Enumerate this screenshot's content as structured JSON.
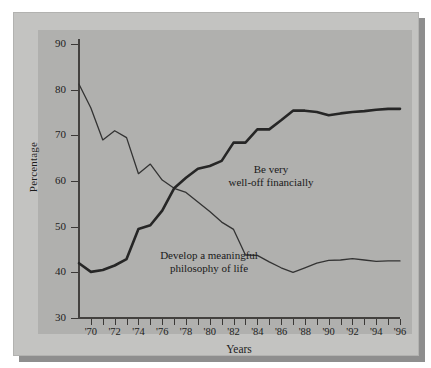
{
  "chart_data": {
    "type": "line",
    "title": "",
    "subtitle": "",
    "xlabel": "Years",
    "ylabel": "Percentage",
    "xlim": [
      1969,
      1996
    ],
    "ylim": [
      30,
      90
    ],
    "ytick_labels": [
      "90",
      "80",
      "70",
      "60",
      "50",
      "40",
      "30"
    ],
    "ytick_values": [
      90,
      80,
      70,
      60,
      50,
      40,
      30
    ],
    "xtick_values": [
      1969,
      1970,
      1971,
      1972,
      1973,
      1974,
      1975,
      1976,
      1977,
      1978,
      1979,
      1980,
      1981,
      1982,
      1983,
      1984,
      1985,
      1986,
      1987,
      1988,
      1989,
      1990,
      1991,
      1992,
      1993,
      1994,
      1995,
      1996
    ],
    "xtick_labels": [
      "'70",
      "'72",
      "'74",
      "'76",
      "'78",
      "'80",
      "'82",
      "'84",
      "'86",
      "'88",
      "'90",
      "'92",
      "'94",
      "'96"
    ],
    "xtick_labeled_values": [
      1970,
      1972,
      1974,
      1976,
      1978,
      1980,
      1982,
      1984,
      1986,
      1988,
      1990,
      1992,
      1994,
      1996
    ],
    "grid": false,
    "legend_position": "inline-annotation",
    "x": [
      1969,
      1970,
      1971,
      1972,
      1973,
      1974,
      1975,
      1976,
      1977,
      1978,
      1979,
      1980,
      1981,
      1982,
      1983,
      1984,
      1985,
      1986,
      1987,
      1988,
      1989,
      1990,
      1991,
      1992,
      1993,
      1994,
      1995,
      1996
    ],
    "series": [
      {
        "name": "Be very well-off financially",
        "label_text": "Be very\nwell-off financially",
        "color": "#262626",
        "linewidth": 2.6,
        "values": [
          42.0,
          40.1,
          40.5,
          41.5,
          42.9,
          49.5,
          50.3,
          53.5,
          58.4,
          60.7,
          62.7,
          63.3,
          64.4,
          68.4,
          68.4,
          71.3,
          71.3,
          73.3,
          75.4,
          75.4,
          75.1,
          74.4,
          74.8,
          75.1,
          75.3,
          75.6,
          75.8,
          75.8
        ]
      },
      {
        "name": "Develop a meaningful philosophy of life",
        "label_text": "Develop a meaningful\nphilosophy of life",
        "color": "#333333",
        "linewidth": 1.3,
        "values": [
          81.2,
          76.0,
          69.0,
          71.0,
          69.5,
          61.6,
          63.7,
          60.2,
          58.4,
          57.5,
          55.4,
          53.3,
          51.0,
          49.4,
          43.8,
          43.7,
          42.3,
          41.0,
          40.0,
          41.0,
          42.0,
          42.6,
          42.7,
          43.0,
          42.7,
          42.4,
          42.5,
          42.5
        ]
      }
    ]
  },
  "annotations": {
    "wealth_label": "Be very\nwell-off financially",
    "philosophy_label": "Develop a meaningful\nphilosophy of life"
  },
  "axes": {
    "y_title": "Percentage",
    "x_title": "Years"
  },
  "colors": {
    "mat_background": "#c3c3c1",
    "plot_background": "#b0b0ae",
    "axis": "#43413f",
    "shadow": "#8e8e8e",
    "text": "#1d1d1d"
  }
}
